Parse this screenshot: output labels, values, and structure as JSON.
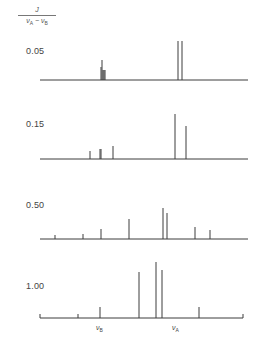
{
  "figure": {
    "type": "NMR spectra stick diagram (AB spin system) for varying J/(νA − νB)",
    "y_label": {
      "numerator": "J",
      "denominator_a": "ν",
      "denominator_a_sub": "A",
      "minus": " − ",
      "denominator_b": "ν",
      "denominator_b_sub": "B"
    },
    "x_axis_labels": [
      {
        "symbol": "ν",
        "sub": "B",
        "x": 100
      },
      {
        "symbol": "ν",
        "sub": "A",
        "x": 176
      }
    ],
    "panels": [
      {
        "label": "0.05",
        "label_pos": [
          26,
          46
        ],
        "baseline_y": 80,
        "x_range": [
          40,
          248
        ],
        "lines": [
          {
            "x": 101,
            "top": 67
          },
          {
            "x": 102,
            "top": 60
          },
          {
            "x": 103,
            "top": 70
          },
          {
            "x": 104,
            "top": 70
          },
          {
            "x": 105,
            "top": 70
          },
          {
            "x": 178,
            "top": 41
          },
          {
            "x": 182,
            "top": 41
          }
        ]
      },
      {
        "label": "0.15",
        "label_pos": [
          26,
          119
        ],
        "baseline_y": 159,
        "x_range": [
          40,
          248
        ],
        "lines": [
          {
            "x": 90,
            "top": 151
          },
          {
            "x": 100,
            "top": 149
          },
          {
            "x": 101,
            "top": 149
          },
          {
            "x": 113,
            "top": 146
          },
          {
            "x": 175,
            "top": 114
          },
          {
            "x": 186,
            "top": 126
          }
        ]
      },
      {
        "label": "0.50",
        "label_pos": [
          26,
          200
        ],
        "baseline_y": 239,
        "x_range": [
          40,
          248
        ],
        "lines": [
          {
            "x": 55,
            "top": 235
          },
          {
            "x": 83,
            "top": 234
          },
          {
            "x": 101,
            "top": 229
          },
          {
            "x": 129,
            "top": 219
          },
          {
            "x": 163,
            "top": 208
          },
          {
            "x": 167,
            "top": 213
          },
          {
            "x": 195,
            "top": 227
          },
          {
            "x": 210,
            "top": 230
          }
        ]
      },
      {
        "label": "1.00",
        "label_pos": [
          26,
          281
        ],
        "baseline_y": 318,
        "x_range": [
          40,
          243
        ],
        "end_ticks": [
          40,
          78,
          243
        ],
        "lines": [
          {
            "x": 100,
            "top": 307
          },
          {
            "x": 139,
            "top": 272
          },
          {
            "x": 156,
            "top": 262
          },
          {
            "x": 162,
            "top": 270
          },
          {
            "x": 199,
            "top": 307
          }
        ]
      }
    ],
    "colors": {
      "line": "#3c3c3c",
      "background": "#ffffff",
      "text": "#444444"
    }
  }
}
